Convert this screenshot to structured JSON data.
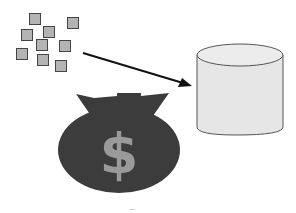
{
  "diagram": {
    "nodes": [
      {
        "id": "data-blocks",
        "type": "square-cluster",
        "count": 9,
        "fill": "#b4b4b4",
        "stroke": "#444444"
      },
      {
        "id": "database",
        "type": "cylinder",
        "fill": "#e6e6e6",
        "stroke": "#555555"
      },
      {
        "id": "money-bag",
        "type": "bag",
        "fill": "#3c3c3c",
        "symbol": "$",
        "symbol_color": "#9a9a9a"
      }
    ],
    "edges": [
      {
        "from": "data-blocks",
        "to": "database",
        "type": "arrow",
        "color": "#111111"
      }
    ],
    "money_symbol": "$",
    "caption": "—"
  }
}
